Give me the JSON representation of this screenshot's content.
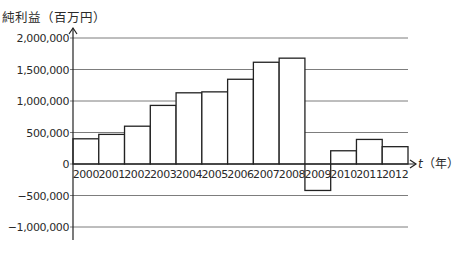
{
  "chart_data": {
    "type": "bar",
    "title": "",
    "ylabel": "純利益（百万円）",
    "xlabel": "t（年）",
    "xlabel_var": "t",
    "xlabel_unit": "（年）",
    "categories": [
      "2000",
      "2001",
      "2002",
      "2003",
      "2004",
      "2005",
      "2006",
      "2007",
      "2008",
      "2009",
      "2010",
      "2011",
      "2012"
    ],
    "values": [
      400000,
      470000,
      600000,
      930000,
      1130000,
      1145000,
      1345000,
      1615000,
      1680000,
      -420000,
      210000,
      390000,
      275000
    ],
    "yticks": [
      2000000,
      1500000,
      1000000,
      500000,
      0,
      -500000,
      -1000000
    ],
    "ytick_labels": [
      "2,000,000",
      "1,500,000",
      "1,000,000",
      "500,000",
      "0",
      "-500,000",
      "-1,000,000"
    ],
    "ylim": [
      -1200000,
      2100000
    ],
    "grid": true,
    "legend": null
  },
  "layout": {
    "axis_x": 73,
    "zero_y": 164,
    "px_per_unit": 6.3e-05,
    "bar_left": 73,
    "bar_right": 408,
    "grid_right": 408,
    "yaxis_top": 28,
    "yaxis_bottom": 240,
    "xaxis_end": 416
  }
}
